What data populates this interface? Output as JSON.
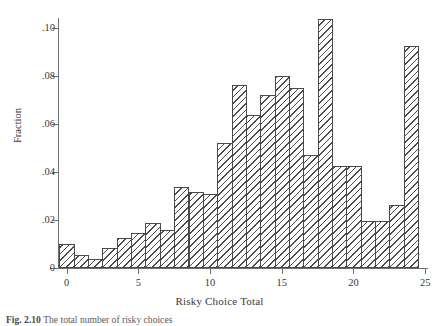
{
  "figure": {
    "caption_label": "Fig. 2.10",
    "caption_text": "The total number of risky choices"
  },
  "chart_data": {
    "type": "bar",
    "title": "",
    "subtitle": "",
    "xlabel": "Risky Choice Total",
    "ylabel": "Fraction",
    "grid": false,
    "legend": "none",
    "xlim": [
      -0.6,
      25.2
    ],
    "ylim": [
      0,
      0.104
    ],
    "xticks": [
      0,
      5,
      10,
      15,
      20,
      25
    ],
    "xtick_labels": [
      "0",
      "5",
      "10",
      "15",
      "20",
      "25"
    ],
    "yticks": [
      0,
      0.02,
      0.04,
      0.06,
      0.08,
      0.1
    ],
    "ytick_labels": [
      "0",
      ".02",
      ".04",
      ".06",
      ".08",
      ".10"
    ],
    "bin_width": 1,
    "categories": [
      0,
      1,
      2,
      3,
      4,
      5,
      6,
      7,
      8,
      9,
      10,
      11,
      12,
      13,
      14,
      15,
      16,
      17,
      18,
      19,
      20,
      21,
      22,
      23,
      24
    ],
    "values": [
      0.0098,
      0.0056,
      0.0036,
      0.0084,
      0.0124,
      0.0144,
      0.0188,
      0.016,
      0.0336,
      0.0316,
      0.0308,
      0.052,
      0.076,
      0.0636,
      0.072,
      0.08,
      0.0748,
      0.0472,
      0.1036,
      0.0424,
      0.0424,
      0.0196,
      0.0196,
      0.0264,
      0.0924
    ],
    "series": [
      {
        "name": "Fraction",
        "values": [
          0.0098,
          0.0056,
          0.0036,
          0.0084,
          0.0124,
          0.0144,
          0.0188,
          0.016,
          0.0336,
          0.0316,
          0.0308,
          0.052,
          0.076,
          0.0636,
          0.072,
          0.08,
          0.0748,
          0.0472,
          0.1036,
          0.0424,
          0.0424,
          0.0196,
          0.0196,
          0.0264,
          0.0924
        ]
      }
    ]
  }
}
